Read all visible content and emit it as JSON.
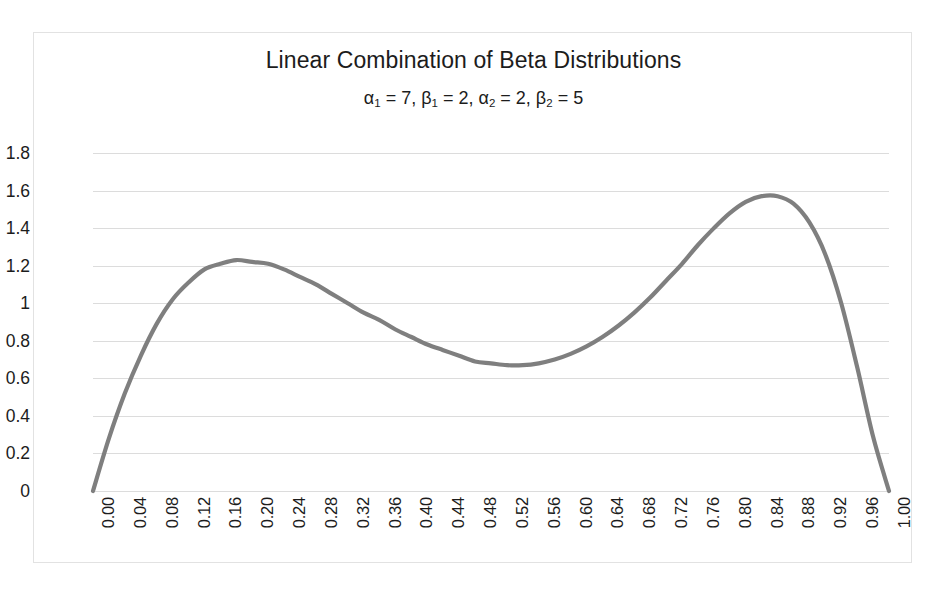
{
  "chart_data": {
    "type": "line",
    "title": "Linear Combination of Beta Distributions",
    "subtitle_parts": {
      "alpha1_label": "α",
      "alpha1_sub": "1",
      "alpha1_value": "7",
      "beta1_label": "β",
      "beta1_sub": "1",
      "beta1_value": "2",
      "alpha2_label": "α",
      "alpha2_sub": "2",
      "alpha2_value": "2",
      "beta2_label": "β",
      "beta2_sub": "2",
      "beta2_value": "5"
    },
    "subtitle": "α1 = 7, β1 = 2, α2 = 2, β2 = 5",
    "xlabel": "",
    "ylabel": "",
    "xlim": [
      0.0,
      1.0
    ],
    "ylim": [
      0.0,
      1.8
    ],
    "grid": true,
    "legend": "none",
    "series_color": "#7f7f7f",
    "grid_color": "#dcdcdc",
    "border_color": "#e2e2e2",
    "ytick_labels": [
      "1.8",
      "1.6",
      "1.4",
      "1.2",
      "1",
      "0.8",
      "0.6",
      "0.4",
      "0.2",
      "0"
    ],
    "ytick_values": [
      1.8,
      1.6,
      1.4,
      1.2,
      1.0,
      0.8,
      0.6,
      0.4,
      0.2,
      0.0
    ],
    "xtick_labels": [
      "0.00",
      "0.04",
      "0.08",
      "0.12",
      "0.16",
      "0.20",
      "0.24",
      "0.28",
      "0.32",
      "0.36",
      "0.40",
      "0.44",
      "0.48",
      "0.52",
      "0.56",
      "0.60",
      "0.64",
      "0.68",
      "0.72",
      "0.76",
      "0.80",
      "0.84",
      "0.88",
      "0.92",
      "0.96",
      "1.00"
    ],
    "xtick_values": [
      0.0,
      0.04,
      0.08,
      0.12,
      0.16,
      0.2,
      0.24,
      0.28,
      0.32,
      0.36,
      0.4,
      0.44,
      0.48,
      0.52,
      0.56,
      0.6,
      0.64,
      0.68,
      0.72,
      0.76,
      0.8,
      0.84,
      0.88,
      0.92,
      0.96,
      1.0
    ],
    "series": [
      {
        "name": "0.5*Beta(7,2) + 0.5*Beta(2,5)",
        "x": [
          0.0,
          0.02,
          0.04,
          0.06,
          0.08,
          0.1,
          0.12,
          0.14,
          0.16,
          0.18,
          0.2,
          0.22,
          0.24,
          0.26,
          0.28,
          0.3,
          0.32,
          0.34,
          0.36,
          0.38,
          0.4,
          0.42,
          0.44,
          0.46,
          0.48,
          0.5,
          0.52,
          0.54,
          0.56,
          0.58,
          0.6,
          0.62,
          0.64,
          0.66,
          0.68,
          0.7,
          0.72,
          0.74,
          0.76,
          0.78,
          0.8,
          0.82,
          0.84,
          0.86,
          0.88,
          0.9,
          0.92,
          0.94,
          0.96,
          0.98,
          1.0
        ],
        "y": [
          0.0,
          0.28,
          0.52,
          0.72,
          0.89,
          1.02,
          1.11,
          1.18,
          1.21,
          1.23,
          1.22,
          1.21,
          1.18,
          1.14,
          1.1,
          1.05,
          1.0,
          0.95,
          0.91,
          0.86,
          0.82,
          0.78,
          0.75,
          0.72,
          0.69,
          0.68,
          0.67,
          0.67,
          0.68,
          0.7,
          0.73,
          0.77,
          0.82,
          0.88,
          0.95,
          1.03,
          1.12,
          1.21,
          1.31,
          1.4,
          1.48,
          1.54,
          1.57,
          1.57,
          1.53,
          1.43,
          1.26,
          1.0,
          0.66,
          0.29,
          0.0
        ],
        "peaks": [
          {
            "x": 0.2,
            "y": 1.22
          },
          {
            "x": 0.855,
            "y": 1.57
          }
        ],
        "valley": {
          "x": 0.51,
          "y": 0.67
        },
        "endpoints": [
          {
            "x": 0.0,
            "y": 0.0
          },
          {
            "x": 1.0,
            "y": 0.0
          }
        ]
      }
    ]
  }
}
